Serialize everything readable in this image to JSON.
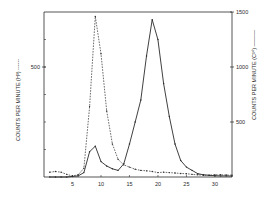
{
  "chart_data": {
    "type": "line",
    "title": "",
    "xlabel": "",
    "x_ticks": [
      5,
      10,
      15,
      20,
      25,
      30
    ],
    "xlim": [
      0,
      33
    ],
    "y_left": {
      "label": "COUNTS PER MINUTE (H³) ------",
      "ticks": [
        500
      ],
      "ylim": [
        0,
        750
      ]
    },
    "y_right": {
      "label": "COUNTS PER MINUTE (C¹⁴) ———",
      "ticks": [
        500,
        1000,
        1500
      ],
      "ylim": [
        0,
        1500
      ]
    },
    "grid": false,
    "legend": "none (series identified in axis labels)",
    "series": [
      {
        "name": "H³ (dashed, left axis)",
        "axis": "left",
        "style": "dashed",
        "x": [
          1,
          2,
          3,
          4,
          5,
          6,
          7,
          8,
          9,
          10,
          11,
          12,
          13,
          14,
          15,
          16,
          17,
          18,
          19,
          20,
          21,
          22,
          23,
          24,
          25,
          26,
          27,
          28,
          29,
          30,
          31,
          32,
          33
        ],
        "values": [
          22,
          25,
          22,
          12,
          5,
          10,
          40,
          320,
          730,
          560,
          300,
          150,
          80,
          55,
          45,
          35,
          30,
          28,
          25,
          20,
          22,
          20,
          18,
          16,
          15,
          12,
          10,
          8,
          8,
          10,
          10,
          9,
          8
        ]
      },
      {
        "name": "C¹⁴ (solid, right axis)",
        "axis": "right",
        "style": "solid",
        "x": [
          1,
          2,
          3,
          4,
          5,
          6,
          7,
          8,
          9,
          10,
          11,
          12,
          13,
          14,
          15,
          16,
          17,
          18,
          19,
          20,
          21,
          22,
          23,
          24,
          25,
          26,
          27,
          28,
          29,
          30,
          31,
          32,
          33
        ],
        "values": [
          0,
          0,
          0,
          0,
          5,
          10,
          40,
          230,
          280,
          140,
          100,
          75,
          60,
          120,
          300,
          500,
          700,
          1100,
          1430,
          1250,
          850,
          550,
          300,
          150,
          90,
          60,
          30,
          20,
          15,
          12,
          10,
          10,
          8
        ]
      }
    ]
  },
  "axes": {
    "x_tick_labels": [
      "5",
      "10",
      "15",
      "20",
      "25",
      "30"
    ],
    "left_tick_labels": [
      "500"
    ],
    "right_tick_labels": [
      "500",
      "1000",
      "1500"
    ],
    "left_label": "COUNTS PER MINUTE (H³) ------",
    "right_label": "COUNTS PER MINUTE (C¹⁴) ———"
  },
  "colors": {
    "ink": "#2a2a2a",
    "background": "#ffffff"
  }
}
